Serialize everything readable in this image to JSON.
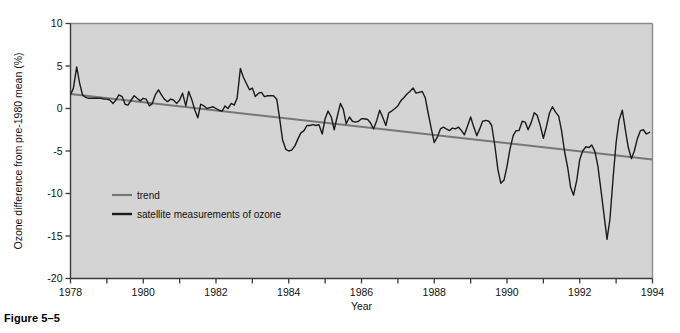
{
  "figure": {
    "caption": "Figure 5–5"
  },
  "chart_data": {
    "type": "line",
    "title": "",
    "xlabel": "Year",
    "ylabel": "Ozone difference from pre-1980 mean (%)",
    "xlim": [
      1978,
      1994
    ],
    "ylim": [
      -20,
      10
    ],
    "grid": false,
    "legend_position": "inside-left",
    "plot_background": "#d4d4d4",
    "xticks": [
      1978,
      1979,
      1980,
      1981,
      1982,
      1983,
      1984,
      1985,
      1986,
      1987,
      1988,
      1989,
      1990,
      1991,
      1992,
      1993,
      1994
    ],
    "xtick_labels": [
      "1978",
      "",
      "1980",
      "",
      "1982",
      "",
      "1984",
      "",
      "1986",
      "",
      "1988",
      "",
      "1990",
      "",
      "1992",
      "",
      "1994"
    ],
    "yticks": [
      10,
      5,
      0,
      -5,
      -10,
      -15,
      -20
    ],
    "ytick_labels": [
      "10",
      "5",
      "0",
      "-5",
      "-10",
      "-15",
      "-20"
    ],
    "series": [
      {
        "name": "trend",
        "type": "line",
        "color": "#777777",
        "width": 2.0,
        "x": [
          1978.0,
          1994.0
        ],
        "values": [
          1.7,
          -6.0
        ]
      },
      {
        "name": "satellite measurements of ozone",
        "type": "line",
        "color": "#1a1a1a",
        "width": 1.4,
        "x": [
          1978.0,
          1978.08,
          1978.17,
          1978.25,
          1978.33,
          1978.42,
          1978.5,
          1978.58,
          1978.67,
          1978.75,
          1978.83,
          1978.92,
          1979.0,
          1979.08,
          1979.17,
          1979.25,
          1979.33,
          1979.42,
          1979.5,
          1979.58,
          1979.67,
          1979.75,
          1979.83,
          1979.92,
          1980.0,
          1980.08,
          1980.17,
          1980.25,
          1980.33,
          1980.42,
          1980.5,
          1980.58,
          1980.67,
          1980.75,
          1980.83,
          1980.92,
          1981.0,
          1981.08,
          1981.17,
          1981.25,
          1981.33,
          1981.42,
          1981.5,
          1981.58,
          1981.67,
          1981.75,
          1981.83,
          1981.92,
          1982.0,
          1982.08,
          1982.17,
          1982.25,
          1982.33,
          1982.42,
          1982.5,
          1982.58,
          1982.67,
          1982.75,
          1982.83,
          1982.92,
          1983.0,
          1983.08,
          1983.17,
          1983.25,
          1983.33,
          1983.42,
          1983.5,
          1983.58,
          1983.67,
          1983.75,
          1983.83,
          1983.92,
          1984.0,
          1984.08,
          1984.17,
          1984.25,
          1984.33,
          1984.42,
          1984.5,
          1984.58,
          1984.67,
          1984.75,
          1984.83,
          1984.92,
          1985.0,
          1985.08,
          1985.17,
          1985.25,
          1985.33,
          1985.42,
          1985.5,
          1985.58,
          1985.67,
          1985.75,
          1985.83,
          1985.92,
          1986.0,
          1986.08,
          1986.17,
          1986.25,
          1986.33,
          1986.42,
          1986.5,
          1986.58,
          1986.67,
          1986.75,
          1986.83,
          1986.92,
          1987.0,
          1987.08,
          1987.17,
          1987.25,
          1987.33,
          1987.42,
          1987.5,
          1987.58,
          1987.67,
          1987.75,
          1987.83,
          1987.92,
          1988.0,
          1988.08,
          1988.17,
          1988.25,
          1988.33,
          1988.42,
          1988.5,
          1988.58,
          1988.67,
          1988.75,
          1988.83,
          1988.92,
          1989.0,
          1989.08,
          1989.17,
          1989.25,
          1989.33,
          1989.42,
          1989.5,
          1989.58,
          1989.67,
          1989.75,
          1989.83,
          1989.92,
          1990.0,
          1990.08,
          1990.17,
          1990.25,
          1990.33,
          1990.42,
          1990.5,
          1990.58,
          1990.67,
          1990.75,
          1990.83,
          1990.92,
          1991.0,
          1991.08,
          1991.17,
          1991.25,
          1991.33,
          1991.42,
          1991.5,
          1991.58,
          1991.67,
          1991.75,
          1991.83,
          1991.92,
          1992.0,
          1992.08,
          1992.17,
          1992.25,
          1992.33,
          1992.42,
          1992.5,
          1992.58,
          1992.67,
          1992.75,
          1992.83,
          1992.92,
          1993.0,
          1993.08,
          1993.17,
          1993.25,
          1993.33,
          1993.42,
          1993.5,
          1993.58,
          1993.67,
          1993.75,
          1993.83,
          1993.92
        ],
        "values": [
          1.6,
          2.4,
          4.9,
          3.0,
          1.6,
          1.3,
          1.2,
          1.2,
          1.2,
          1.2,
          1.2,
          1.1,
          1.1,
          1.0,
          0.6,
          1.0,
          1.6,
          1.4,
          0.5,
          0.4,
          1.0,
          1.5,
          1.2,
          0.9,
          1.2,
          1.1,
          0.3,
          0.6,
          1.6,
          2.2,
          1.6,
          1.1,
          0.8,
          1.1,
          1.0,
          0.6,
          1.0,
          1.8,
          0.3,
          2.0,
          1.1,
          -0.2,
          -1.1,
          0.5,
          0.3,
          0.0,
          0.1,
          0.2,
          0.0,
          -0.2,
          -0.3,
          0.3,
          0.0,
          0.6,
          0.4,
          1.2,
          4.7,
          3.7,
          3.0,
          2.2,
          2.4,
          1.4,
          1.8,
          1.9,
          1.4,
          1.5,
          1.5,
          1.5,
          1.1,
          -1.2,
          -3.7,
          -4.8,
          -5.0,
          -4.9,
          -4.4,
          -3.6,
          -2.9,
          -2.6,
          -2.0,
          -2.0,
          -1.9,
          -2.0,
          -1.9,
          -3.0,
          -1.2,
          -0.3,
          -1.0,
          -2.5,
          -1.0,
          0.6,
          -0.1,
          -1.8,
          -1.0,
          -1.5,
          -1.6,
          -1.5,
          -1.2,
          -1.2,
          -1.3,
          -1.7,
          -2.4,
          -1.4,
          -0.2,
          -1.0,
          -2.0,
          -0.5,
          -0.3,
          0.0,
          0.3,
          0.9,
          1.3,
          1.7,
          2.0,
          2.4,
          1.8,
          1.9,
          2.0,
          1.3,
          -0.5,
          -2.4,
          -4.0,
          -3.4,
          -2.4,
          -2.2,
          -2.4,
          -2.6,
          -2.3,
          -2.4,
          -2.2,
          -2.6,
          -3.1,
          -2.0,
          -1.0,
          -2.1,
          -3.2,
          -2.4,
          -1.5,
          -1.4,
          -1.5,
          -2.0,
          -4.5,
          -7.2,
          -8.8,
          -8.4,
          -6.8,
          -4.8,
          -3.2,
          -2.6,
          -2.6,
          -1.5,
          -1.6,
          -2.5,
          -1.6,
          -0.5,
          -0.8,
          -2.1,
          -3.5,
          -2.2,
          -0.5,
          0.2,
          -0.4,
          -0.9,
          -2.6,
          -5.0,
          -7.0,
          -9.3,
          -10.2,
          -8.4,
          -6.0,
          -5.0,
          -4.5,
          -4.6,
          -4.3,
          -5.1,
          -6.8,
          -9.5,
          -12.6,
          -15.4,
          -13.0,
          -8.0,
          -4.0,
          -1.4,
          -0.2,
          -2.4,
          -4.5,
          -5.9,
          -5.0,
          -3.6,
          -2.6,
          -2.5,
          -3.0,
          -2.8
        ]
      }
    ],
    "legend": [
      {
        "label": "trend",
        "color": "#777777"
      },
      {
        "label": "satellite measurements of ozone",
        "color": "#1a1a1a"
      }
    ]
  }
}
